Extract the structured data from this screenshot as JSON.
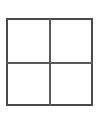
{
  "figure": {
    "name": "2x2-grid",
    "type": "grid",
    "rows": 2,
    "columns": 2,
    "line_color": "#4a4a4a",
    "divider_color": "#5a5a5a",
    "background_color": "#ffffff",
    "cells": [
      {
        "id": "top-left",
        "label": ""
      },
      {
        "id": "top-right",
        "label": ""
      },
      {
        "id": "bottom-left",
        "label": ""
      },
      {
        "id": "bottom-right",
        "label": ""
      }
    ]
  }
}
